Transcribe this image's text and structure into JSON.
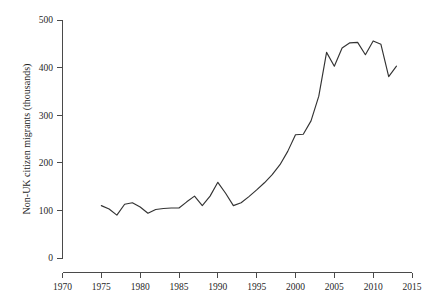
{
  "chart_data": {
    "type": "line",
    "title": "",
    "subtitle": "",
    "xlabel": "",
    "ylabel": "Non-UK citizen migrants (thousands)",
    "xlim": [
      1970,
      2015
    ],
    "ylim": [
      0,
      500
    ],
    "xticks": [
      1970,
      1975,
      1980,
      1985,
      1990,
      1995,
      2000,
      2005,
      2010,
      2015
    ],
    "xtick_labels": [
      "1970",
      "1975",
      "1980",
      "1985",
      "1990",
      "1995",
      "2000",
      "2005",
      "2010",
      "2015"
    ],
    "yticks": [
      0,
      100,
      200,
      300,
      400,
      500
    ],
    "ytick_labels": [
      "0",
      "100",
      "200",
      "300",
      "400",
      "500"
    ],
    "grid": false,
    "legend": false,
    "legend_position": "none",
    "line_color": "#333333",
    "background_color": "#ffffff",
    "axis_color": "#4a4a4a",
    "series": [
      {
        "name": "Non-UK citizen migrants",
        "x": [
          1975,
          1976,
          1977,
          1978,
          1979,
          1980,
          1981,
          1982,
          1983,
          1984,
          1985,
          1986,
          1987,
          1988,
          1989,
          1990,
          1991,
          1992,
          1993,
          1994,
          1995,
          1996,
          1997,
          1998,
          1999,
          2000,
          2001,
          2002,
          2003,
          2004,
          2005,
          2006,
          2007,
          2008,
          2009,
          2010,
          2011,
          2012,
          2013
        ],
        "values": [
          110,
          103,
          90,
          113,
          116,
          107,
          94,
          102,
          104,
          105,
          105,
          118,
          130,
          110,
          130,
          159,
          136,
          110,
          116,
          129,
          143,
          158,
          175,
          196,
          224,
          259,
          260,
          288,
          340,
          432,
          403,
          441,
          452,
          453,
          427,
          456,
          449,
          381,
          403
        ]
      }
    ]
  },
  "figure": {
    "caption": ""
  }
}
